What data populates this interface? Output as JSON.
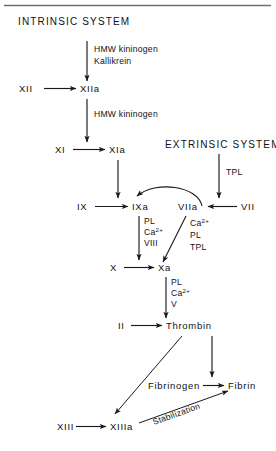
{
  "diagram": {
    "title_intrinsic": "INTRINSIC SYSTEM",
    "title_extrinsic": "EXTRINSIC SYSTEM",
    "nodes": {
      "xii": "XII",
      "xiia": "XIIa",
      "xi": "XI",
      "xia": "XIa",
      "ix": "IX",
      "ixa": "IXa",
      "viia": "VIIa",
      "vii": "VII",
      "x": "X",
      "xa": "Xa",
      "ii": "II",
      "thrombin": "Thrombin",
      "fibrinogen": "Fibrinogen",
      "fibrin": "Fibrin",
      "xiii": "XIII",
      "xiiia": "XIIIa"
    },
    "edge_labels": {
      "hmw_kininogen_1": "HMW kininogen",
      "kallikrein": "Kallikrein",
      "hmw_kininogen_2": "HMW kininogen",
      "tpl_extrinsic": "TPL",
      "stabilization": "Stabilization"
    },
    "cofactors": {
      "ixa_complex": [
        "PL",
        "Ca",
        "VIII"
      ],
      "ixa_ca_charge": "2+",
      "viia_complex": [
        "Ca",
        "PL",
        "TPL"
      ],
      "viia_ca_charge": "2+",
      "xa_complex": [
        "PL",
        "Ca",
        "V"
      ],
      "xa_ca_charge": "2+"
    },
    "colors": {
      "ink": "#111111",
      "rule": "#6f6f6f",
      "background": "#ffffff"
    }
  }
}
